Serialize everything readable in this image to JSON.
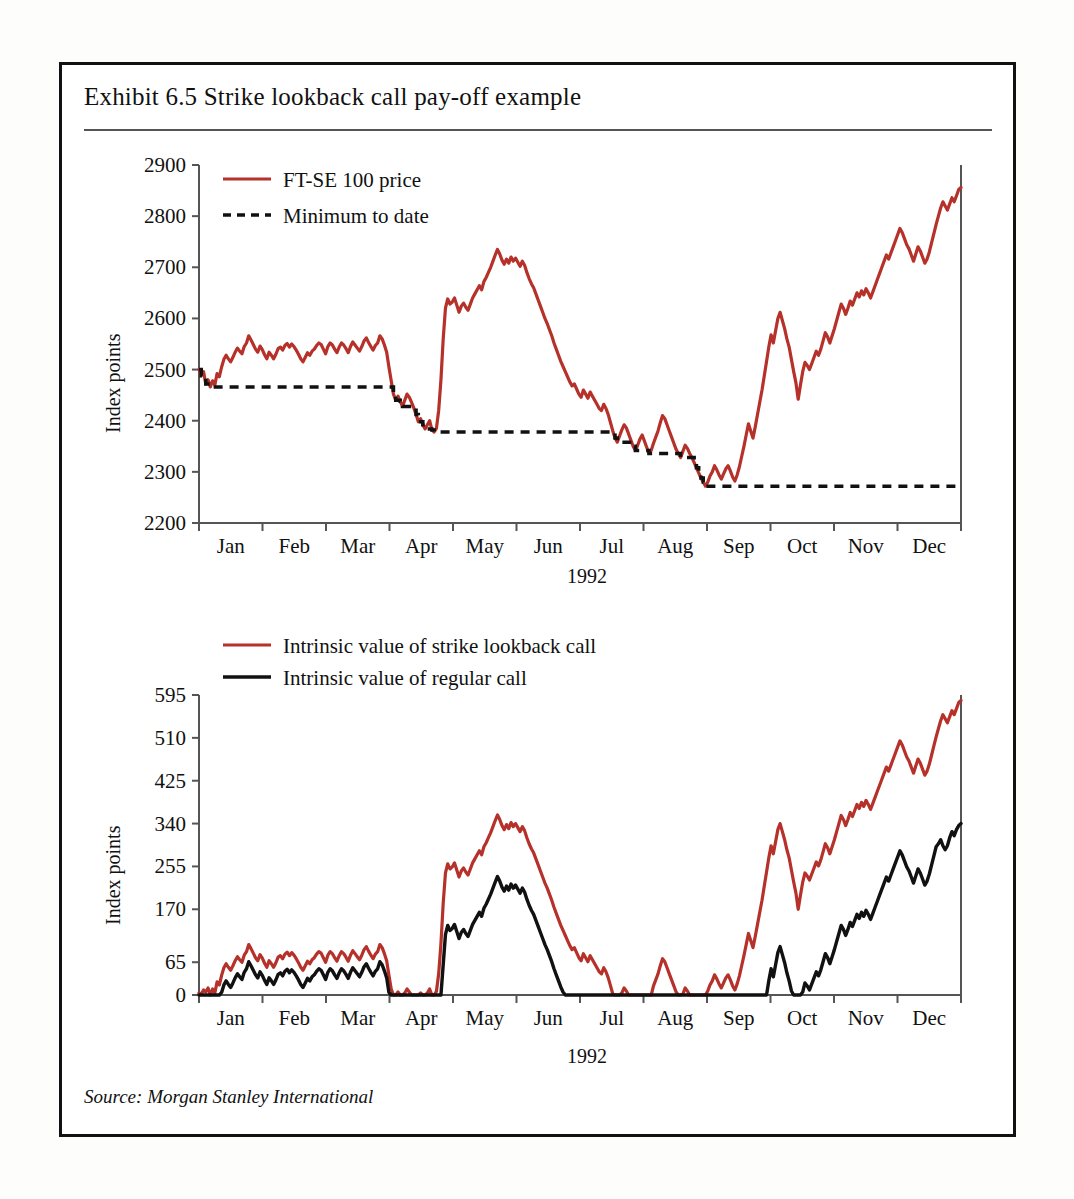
{
  "exhibit": {
    "title": "Exhibit 6.5  Strike lookback call pay-off example",
    "source": "Source: Morgan Stanley International"
  },
  "colors": {
    "series_red": "#b5312a",
    "series_black": "#111111",
    "axis": "#555555",
    "frame": "#111111",
    "background": "#ffffff"
  },
  "chart_data": [
    {
      "type": "line",
      "title": "FT-SE 100 price and minimum to date",
      "xlabel": "1992",
      "ylabel": "Index points",
      "ylim": [
        2200,
        2900
      ],
      "yticks": [
        2200,
        2300,
        2400,
        2500,
        2600,
        2700,
        2800,
        2900
      ],
      "grid": false,
      "legend_position": "top-left",
      "categories": [
        "Jan",
        "Feb",
        "Mar",
        "Apr",
        "May",
        "Jun",
        "Jul",
        "Aug",
        "Sep",
        "Oct",
        "Nov",
        "Dec"
      ],
      "series": [
        {
          "name": "FT-SE 100 price",
          "style": "solid",
          "color": "#b5312a",
          "values": [
            2500,
            2488,
            2496,
            2472,
            2480,
            2466,
            2478,
            2470,
            2492,
            2486,
            2505,
            2520,
            2528,
            2521,
            2515,
            2524,
            2534,
            2542,
            2536,
            2531,
            2545,
            2552,
            2566,
            2558,
            2549,
            2540,
            2534,
            2546,
            2539,
            2529,
            2521,
            2534,
            2528,
            2521,
            2530,
            2541,
            2544,
            2538,
            2547,
            2551,
            2544,
            2550,
            2545,
            2538,
            2530,
            2521,
            2515,
            2524,
            2533,
            2528,
            2536,
            2540,
            2547,
            2552,
            2549,
            2540,
            2531,
            2545,
            2552,
            2548,
            2540,
            2533,
            2544,
            2552,
            2548,
            2541,
            2533,
            2545,
            2554,
            2548,
            2542,
            2536,
            2545,
            2556,
            2562,
            2553,
            2545,
            2538,
            2547,
            2552,
            2566,
            2560,
            2548,
            2534,
            2505,
            2478,
            2452,
            2440,
            2448,
            2438,
            2428,
            2440,
            2452,
            2446,
            2436,
            2425,
            2412,
            2398,
            2404,
            2392,
            2384,
            2392,
            2400,
            2382,
            2378,
            2385,
            2420,
            2480,
            2560,
            2620,
            2638,
            2628,
            2632,
            2640,
            2626,
            2612,
            2624,
            2630,
            2622,
            2616,
            2628,
            2640,
            2648,
            2656,
            2664,
            2656,
            2672,
            2680,
            2690,
            2700,
            2712,
            2724,
            2735,
            2726,
            2714,
            2706,
            2716,
            2708,
            2720,
            2712,
            2718,
            2710,
            2702,
            2712,
            2704,
            2690,
            2678,
            2668,
            2660,
            2648,
            2636,
            2624,
            2612,
            2600,
            2590,
            2578,
            2566,
            2552,
            2540,
            2528,
            2516,
            2506,
            2496,
            2486,
            2476,
            2468,
            2472,
            2462,
            2452,
            2446,
            2460,
            2452,
            2444,
            2456,
            2448,
            2440,
            2432,
            2424,
            2420,
            2432,
            2424,
            2412,
            2396,
            2380,
            2366,
            2358,
            2370,
            2382,
            2392,
            2386,
            2374,
            2362,
            2350,
            2342,
            2352,
            2364,
            2372,
            2360,
            2348,
            2336,
            2342,
            2356,
            2368,
            2380,
            2396,
            2410,
            2404,
            2392,
            2380,
            2368,
            2356,
            2344,
            2336,
            2328,
            2340,
            2352,
            2346,
            2336,
            2328,
            2318,
            2308,
            2298,
            2288,
            2280,
            2272,
            2280,
            2292,
            2300,
            2312,
            2304,
            2294,
            2286,
            2296,
            2306,
            2312,
            2302,
            2290,
            2282,
            2294,
            2310,
            2330,
            2350,
            2372,
            2394,
            2380,
            2366,
            2388,
            2412,
            2436,
            2460,
            2488,
            2516,
            2544,
            2568,
            2552,
            2576,
            2600,
            2612,
            2596,
            2580,
            2560,
            2544,
            2520,
            2496,
            2474,
            2442,
            2470,
            2496,
            2514,
            2508,
            2500,
            2512,
            2524,
            2536,
            2528,
            2540,
            2556,
            2572,
            2564,
            2552,
            2566,
            2580,
            2596,
            2612,
            2628,
            2620,
            2608,
            2620,
            2634,
            2626,
            2638,
            2650,
            2642,
            2654,
            2646,
            2658,
            2650,
            2640,
            2652,
            2664,
            2676,
            2688,
            2700,
            2712,
            2724,
            2716,
            2728,
            2740,
            2752,
            2764,
            2776,
            2768,
            2756,
            2744,
            2736,
            2724,
            2712,
            2726,
            2740,
            2732,
            2720,
            2708,
            2716,
            2730,
            2748,
            2766,
            2784,
            2800,
            2816,
            2828,
            2820,
            2812,
            2824,
            2836,
            2828,
            2840,
            2852,
            2856
          ]
        },
        {
          "name": "Minimum to date",
          "style": "dashed",
          "color": "#111111",
          "description": "running minimum of the FT-SE 100 price, drawn as a descending step function",
          "steps": [
            {
              "from_month": "Jan",
              "level": 2466
            },
            {
              "from_month": "Mar",
              "level": 2425
            },
            {
              "from_month": "Mar",
              "level": 2378
            },
            {
              "from_month": "Jul",
              "level": 2336
            },
            {
              "from_month": "Aug",
              "level": 2272
            }
          ]
        }
      ]
    },
    {
      "type": "line",
      "title": "Intrinsic value of strike lookback call vs regular call",
      "xlabel": "1992",
      "ylabel": "Index points",
      "ylim": [
        0,
        595
      ],
      "yticks": [
        0,
        65,
        170,
        255,
        340,
        425,
        510,
        595
      ],
      "grid": false,
      "legend_position": "top-left",
      "categories": [
        "Jan",
        "Feb",
        "Mar",
        "Apr",
        "May",
        "Jun",
        "Jul",
        "Aug",
        "Sep",
        "Oct",
        "Nov",
        "Dec"
      ],
      "series": [
        {
          "name": "Intrinsic value of strike lookback call",
          "style": "solid",
          "color": "#b5312a",
          "values": [
            4,
            2,
            10,
            6,
            14,
            0,
            12,
            4,
            26,
            20,
            39,
            54,
            62,
            55,
            49,
            58,
            68,
            76,
            70,
            65,
            79,
            86,
            100,
            92,
            83,
            74,
            68,
            80,
            73,
            63,
            55,
            68,
            62,
            55,
            64,
            75,
            78,
            72,
            81,
            85,
            78,
            84,
            79,
            72,
            64,
            55,
            49,
            58,
            67,
            62,
            70,
            74,
            81,
            86,
            83,
            74,
            65,
            79,
            86,
            82,
            74,
            67,
            78,
            86,
            82,
            75,
            67,
            79,
            88,
            82,
            76,
            70,
            79,
            90,
            96,
            87,
            79,
            72,
            81,
            86,
            100,
            94,
            82,
            68,
            39,
            12,
            0,
            0,
            6,
            0,
            0,
            4,
            12,
            6,
            0,
            0,
            0,
            0,
            4,
            0,
            0,
            4,
            12,
            0,
            0,
            7,
            42,
            102,
            182,
            242,
            260,
            250,
            254,
            262,
            248,
            234,
            246,
            252,
            244,
            238,
            250,
            262,
            270,
            278,
            286,
            278,
            294,
            302,
            312,
            322,
            334,
            346,
            357,
            348,
            336,
            328,
            338,
            330,
            342,
            334,
            340,
            332,
            324,
            334,
            326,
            312,
            300,
            290,
            282,
            270,
            258,
            246,
            234,
            222,
            212,
            200,
            188,
            174,
            162,
            150,
            138,
            128,
            118,
            108,
            98,
            90,
            94,
            84,
            74,
            68,
            82,
            74,
            66,
            78,
            70,
            62,
            54,
            46,
            42,
            54,
            46,
            34,
            18,
            2,
            0,
            0,
            0,
            4,
            14,
            8,
            0,
            0,
            0,
            0,
            0,
            0,
            0,
            0,
            0,
            0,
            0,
            18,
            30,
            42,
            58,
            72,
            66,
            54,
            42,
            30,
            18,
            6,
            0,
            0,
            2,
            14,
            8,
            0,
            0,
            0,
            0,
            0,
            0,
            0,
            0,
            8,
            20,
            28,
            40,
            32,
            22,
            14,
            24,
            34,
            40,
            30,
            18,
            10,
            22,
            38,
            58,
            78,
            100,
            122,
            108,
            94,
            116,
            140,
            164,
            188,
            216,
            244,
            272,
            296,
            280,
            304,
            328,
            340,
            324,
            308,
            288,
            272,
            248,
            224,
            202,
            170,
            198,
            224,
            242,
            236,
            228,
            240,
            252,
            264,
            256,
            268,
            284,
            300,
            292,
            280,
            294,
            308,
            324,
            340,
            356,
            348,
            336,
            348,
            362,
            354,
            366,
            378,
            370,
            382,
            374,
            386,
            378,
            368,
            380,
            392,
            404,
            416,
            428,
            440,
            452,
            444,
            456,
            468,
            480,
            492,
            504,
            496,
            484,
            472,
            464,
            452,
            440,
            454,
            468,
            460,
            448,
            436,
            444,
            458,
            476,
            494,
            512,
            528,
            544,
            556,
            548,
            540,
            552,
            564,
            556,
            568,
            580,
            584
          ]
        },
        {
          "name": "Intrinsic value of regular call",
          "style": "solid",
          "color": "#111111",
          "values": [
            0,
            0,
            0,
            0,
            0,
            0,
            0,
            0,
            0,
            0,
            5,
            20,
            28,
            21,
            15,
            24,
            34,
            42,
            36,
            31,
            45,
            52,
            66,
            58,
            49,
            40,
            34,
            46,
            39,
            29,
            21,
            34,
            28,
            21,
            30,
            41,
            44,
            38,
            47,
            51,
            44,
            50,
            45,
            38,
            30,
            21,
            15,
            24,
            33,
            28,
            36,
            40,
            47,
            52,
            49,
            40,
            31,
            45,
            52,
            48,
            40,
            33,
            44,
            52,
            48,
            41,
            33,
            45,
            54,
            48,
            42,
            36,
            45,
            56,
            62,
            53,
            45,
            38,
            47,
            52,
            66,
            60,
            48,
            34,
            5,
            0,
            0,
            0,
            0,
            0,
            0,
            0,
            0,
            0,
            0,
            0,
            0,
            0,
            0,
            0,
            0,
            0,
            0,
            0,
            0,
            0,
            0,
            0,
            60,
            120,
            138,
            128,
            132,
            140,
            126,
            112,
            124,
            130,
            122,
            116,
            128,
            140,
            148,
            156,
            164,
            156,
            172,
            180,
            190,
            200,
            212,
            224,
            235,
            226,
            214,
            206,
            216,
            208,
            220,
            212,
            218,
            210,
            202,
            212,
            204,
            190,
            178,
            168,
            160,
            148,
            136,
            124,
            112,
            100,
            90,
            78,
            66,
            52,
            40,
            28,
            16,
            6,
            0,
            0,
            0,
            0,
            0,
            0,
            0,
            0,
            0,
            0,
            0,
            0,
            0,
            0,
            0,
            0,
            0,
            0,
            0,
            0,
            0,
            0,
            0,
            0,
            0,
            0,
            0,
            0,
            0,
            0,
            0,
            0,
            0,
            0,
            0,
            0,
            0,
            0,
            0,
            0,
            0,
            0,
            0,
            0,
            0,
            0,
            0,
            0,
            0,
            0,
            0,
            0,
            0,
            0,
            0,
            0,
            0,
            0,
            0,
            0,
            0,
            0,
            0,
            0,
            0,
            0,
            0,
            0,
            0,
            0,
            0,
            0,
            0,
            0,
            0,
            0,
            0,
            0,
            0,
            0,
            0,
            0,
            0,
            0,
            0,
            0,
            0,
            0,
            0,
            0,
            28,
            52,
            36,
            60,
            84,
            96,
            80,
            64,
            44,
            28,
            8,
            0,
            0,
            0,
            0,
            6,
            24,
            18,
            10,
            22,
            34,
            46,
            38,
            50,
            66,
            82,
            74,
            62,
            76,
            90,
            106,
            122,
            138,
            130,
            118,
            130,
            144,
            136,
            148,
            160,
            152,
            164,
            156,
            168,
            160,
            150,
            162,
            174,
            186,
            198,
            210,
            222,
            234,
            226,
            238,
            250,
            262,
            274,
            286,
            278,
            266,
            254,
            246,
            234,
            222,
            236,
            250,
            242,
            230,
            218,
            226,
            240,
            258,
            276,
            294,
            300,
            308,
            296,
            288,
            296,
            312,
            324,
            316,
            328,
            336,
            340
          ]
        }
      ]
    }
  ]
}
